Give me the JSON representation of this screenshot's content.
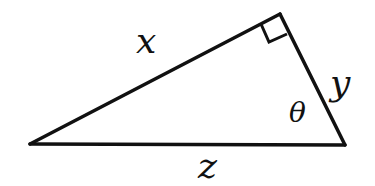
{
  "diagram": {
    "type": "right-triangle",
    "colors": {
      "stroke": "#111111",
      "background": "#ffffff"
    },
    "vertices": {
      "left": {
        "x": 30,
        "y": 144
      },
      "top": {
        "x": 280,
        "y": 14
      },
      "right": {
        "x": 345,
        "y": 145
      }
    },
    "right_angle_at": "top",
    "labels": {
      "hypotenuse_adjacent_left": "x",
      "short_leg": "y",
      "base": "z",
      "angle": "θ"
    },
    "sides": [
      {
        "name": "x",
        "from": "left",
        "to": "top"
      },
      {
        "name": "y",
        "from": "top",
        "to": "right"
      },
      {
        "name": "z",
        "from": "left",
        "to": "right"
      }
    ],
    "angle_marker": {
      "symbol": "θ",
      "at_vertex": "right"
    }
  }
}
